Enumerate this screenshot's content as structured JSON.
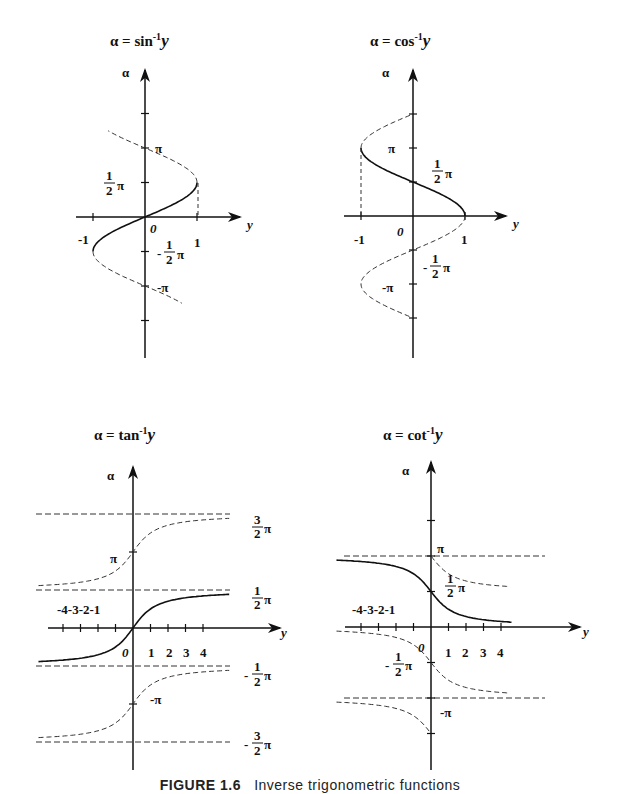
{
  "figure": {
    "caption_label": "FIGURE 1.6",
    "caption_text": "Inverse trigonometric functions"
  },
  "colors": {
    "ink": "#111111",
    "background": "#ffffff"
  },
  "chart_data": [
    {
      "type": "line",
      "title": "α = sin⁻¹y",
      "xlabel": "y",
      "ylabel": "α",
      "xlim": [
        -1,
        1
      ],
      "ylim": [
        -1.5,
        1.5
      ],
      "x_ticks": [
        "-1",
        "0",
        "1"
      ],
      "y_ticks": [
        "-π",
        "-½π",
        "½π",
        "π"
      ],
      "series": [
        {
          "name": "principal branch (solid)",
          "style": "solid",
          "x": [
            -1,
            -0.707,
            0,
            0.707,
            1
          ],
          "y_pi": [
            -0.5,
            -0.25,
            0,
            0.25,
            0.5
          ]
        },
        {
          "name": "other branches (dashed)",
          "style": "dashed",
          "y_pi_range": [
            -1.25,
            1.25
          ]
        }
      ]
    },
    {
      "type": "line",
      "title": "α = cos⁻¹y",
      "xlabel": "y",
      "ylabel": "α",
      "xlim": [
        -1,
        1
      ],
      "ylim": [
        -1.5,
        1.5
      ],
      "x_ticks": [
        "-1",
        "0",
        "1"
      ],
      "y_ticks": [
        "-π",
        "-½π",
        "½π",
        "π"
      ],
      "series": [
        {
          "name": "principal branch (solid)",
          "style": "solid",
          "x": [
            1,
            0.707,
            0,
            -0.707,
            -1
          ],
          "y_pi": [
            0,
            0.25,
            0.5,
            0.75,
            1
          ]
        },
        {
          "name": "other branches (dashed)",
          "style": "dashed",
          "y_pi_range": [
            -1,
            1.5
          ]
        }
      ]
    },
    {
      "type": "line",
      "title": "α = tan⁻¹y",
      "xlabel": "y",
      "ylabel": "α",
      "xlim": [
        -5,
        5
      ],
      "ylim": [
        -1.5,
        1.5
      ],
      "x_ticks": [
        "-4",
        "-3",
        "-2",
        "-1",
        "0",
        "1",
        "2",
        "3",
        "4"
      ],
      "y_ticks": [
        "-3/2π",
        "-π",
        "-½π",
        "½π",
        "π",
        "3/2π"
      ],
      "asymptotes_pi": [
        -1.5,
        -0.5,
        0.5,
        1.5
      ],
      "series": [
        {
          "name": "principal branch (solid)",
          "style": "solid",
          "x": [
            -5,
            -1,
            0,
            1,
            5
          ],
          "y_pi": [
            -0.437,
            -0.25,
            0,
            0.25,
            0.437
          ]
        },
        {
          "name": "branch +π (dashed)",
          "style": "dashed",
          "offset_pi": 1
        },
        {
          "name": "branch −π (dashed)",
          "style": "dashed",
          "offset_pi": -1
        }
      ]
    },
    {
      "type": "line",
      "title": "α = cot⁻¹y",
      "xlabel": "y",
      "ylabel": "α",
      "xlim": [
        -5,
        5
      ],
      "ylim": [
        -1.5,
        1.5
      ],
      "x_ticks": [
        "-4",
        "-3",
        "-2",
        "-1",
        "0",
        "1",
        "2",
        "3",
        "4"
      ],
      "y_ticks": [
        "-π",
        "-½π",
        "½π",
        "π"
      ],
      "asymptotes_pi": [
        -1,
        0,
        1
      ],
      "series": [
        {
          "name": "principal branch (solid)",
          "style": "solid",
          "x": [
            -5,
            -1,
            0,
            1,
            5
          ],
          "y_pi": [
            0.937,
            0.75,
            0.5,
            0.25,
            0.063
          ]
        },
        {
          "name": "branch +π (dashed, y>0)",
          "style": "dashed",
          "offset_pi": 1
        },
        {
          "name": "branch −π/0 (dashed)",
          "style": "dashed",
          "offset_pi": -1
        }
      ]
    }
  ],
  "panels": {
    "sin": {
      "title_prefix": "α = sin",
      "title_sup": "-1",
      "title_var": "y",
      "axis_alpha": "α",
      "axis_y": "y",
      "origin": "0",
      "x_neg1": "-1",
      "x_pos1": "1",
      "pi": "π",
      "neg_pi": "-π",
      "half": "1",
      "half_den": "2",
      "neg": "-"
    },
    "cos": {
      "title_prefix": "α = cos",
      "title_sup": "-1",
      "title_var": "y",
      "axis_alpha": "α",
      "axis_y": "y",
      "origin": "0",
      "x_neg1": "-1",
      "x_pos1": "1",
      "pi": "π",
      "neg_pi": "-π",
      "half": "1",
      "half_den": "2",
      "neg": "-"
    },
    "tan": {
      "title_prefix": "α = tan",
      "title_sup": "-1",
      "title_var": "y",
      "axis_alpha": "α",
      "axis_y": "y",
      "origin": "0",
      "neg_ticks": "-4-3-2-1",
      "pos_ticks": [
        "1",
        "2",
        "3",
        "4"
      ],
      "pi": "π",
      "neg_pi": "-π",
      "three": "3",
      "half": "1",
      "den": "2",
      "neg": "-"
    },
    "cot": {
      "title_prefix": "α = cot",
      "title_sup": "-1",
      "title_var": "y",
      "axis_alpha": "α",
      "axis_y": "y",
      "origin": "0",
      "neg_ticks": "-4-3-2-1",
      "pos_ticks": [
        "1",
        "2",
        "3",
        "4"
      ],
      "pi": "π",
      "neg_pi": "-π",
      "half": "1",
      "den": "2",
      "neg": "-"
    }
  }
}
